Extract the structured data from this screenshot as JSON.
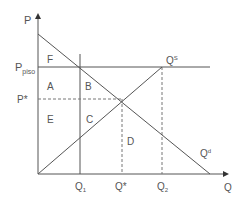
{
  "diagram": {
    "axes": {
      "y_label": "P",
      "x_label": "Q"
    },
    "price_labels": {
      "floor_main": "P",
      "floor_sub": "piso",
      "equilibrium": "P*"
    },
    "quantity_labels": {
      "q1_main": "Q",
      "q1_sub": "1",
      "q_star": "Q*",
      "q2_main": "Q",
      "q2_sub": "2"
    },
    "curves": {
      "supply_main": "Q",
      "supply_sup": "S",
      "demand_main": "Q",
      "demand_sup": "d"
    },
    "regions": {
      "F": "F",
      "A": "A",
      "B": "B",
      "E": "E",
      "C": "C",
      "D": "D"
    },
    "colors": {
      "line": "#555555",
      "dashed": "#777777",
      "text": "#555555"
    }
  }
}
